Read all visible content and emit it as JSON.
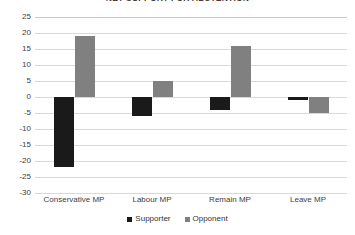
{
  "chart_data": {
    "type": "bar",
    "title": "NET SUPPORT FOR ABSTENTION",
    "xlabel": "",
    "ylabel": "",
    "categories": [
      "Conservative MP",
      "Labour MP",
      "Remain MP",
      "Leave MP"
    ],
    "series": [
      {
        "name": "Supporter",
        "color": "#1a1a1a",
        "values": [
          -22,
          -6,
          -4,
          -1
        ]
      },
      {
        "name": "Opponent",
        "color": "#808080",
        "values": [
          19,
          5,
          16,
          -5
        ]
      }
    ],
    "ylim": [
      -30,
      25
    ],
    "ytick_step": 5,
    "yticks": [
      25,
      20,
      15,
      10,
      5,
      0,
      -5,
      -10,
      -15,
      -20,
      -25,
      -30
    ],
    "ytick_labels": [
      "25",
      "20",
      "15",
      "10",
      "5",
      "0",
      "-5",
      "-10",
      "-15",
      "-20",
      "-25",
      "-30"
    ],
    "grid": "horizontal",
    "legend_position": "bottom-center"
  },
  "legend": {
    "entries": [
      {
        "label": "Supporter",
        "swatch": "supporter"
      },
      {
        "label": "Opponent",
        "swatch": "opponent"
      }
    ]
  }
}
